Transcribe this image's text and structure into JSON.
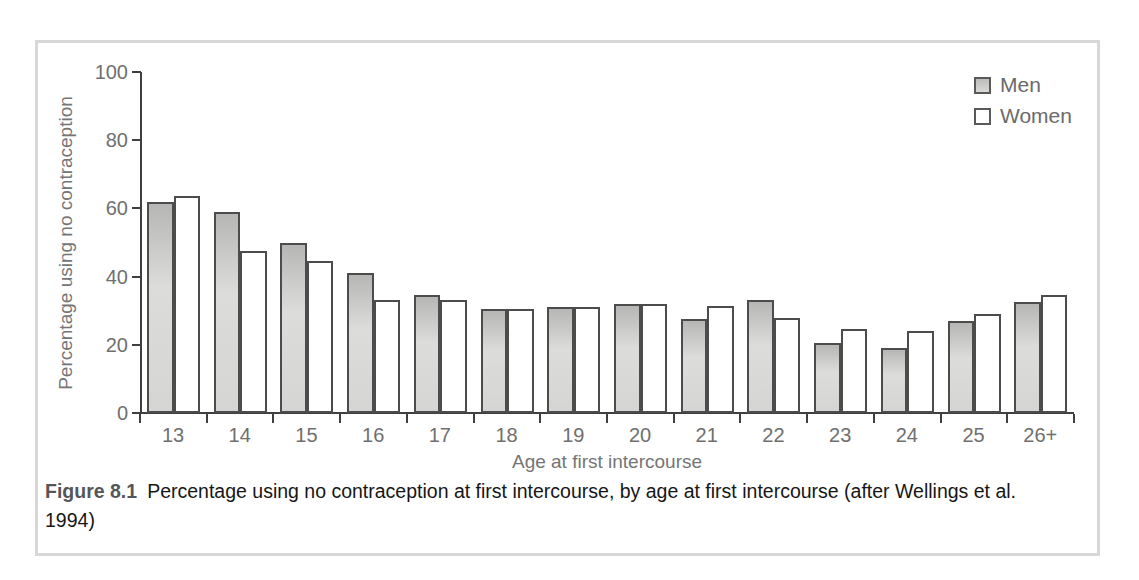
{
  "chart_data": {
    "type": "bar",
    "categories": [
      "13",
      "14",
      "15",
      "16",
      "17",
      "18",
      "19",
      "20",
      "21",
      "22",
      "23",
      "24",
      "25",
      "26+"
    ],
    "series": [
      {
        "name": "Men",
        "values": [
          62,
          59,
          50,
          41,
          34.5,
          30.5,
          31,
          32,
          27.5,
          33,
          20.5,
          19,
          27,
          32.5
        ]
      },
      {
        "name": "Women",
        "values": [
          63.5,
          47.5,
          44.5,
          33,
          33,
          30.5,
          31,
          32,
          31.5,
          28,
          24.5,
          24,
          29,
          34.5
        ]
      }
    ],
    "title": "",
    "xlabel": "Age at first intercourse",
    "ylabel": "Percentage using no contraception",
    "ylim": [
      0,
      100
    ],
    "yticks": [
      0,
      20,
      40,
      60,
      80,
      100
    ],
    "grid": false,
    "legend_position": "top-right",
    "colors": {
      "men_fill": "#d5d5d3",
      "men_fill_top": "#b6b6b4",
      "women_fill": "#ffffff",
      "bar_border": "#4c4c4c",
      "axis": "#3f3f3f",
      "tick_text": "#6f6f6f",
      "frame_border": "#d8d8d6"
    }
  },
  "caption": {
    "label": "Figure 8.1",
    "text": "Percentage using no contraception at first intercourse, by age at first intercourse (after Wellings et al. 1994)"
  }
}
